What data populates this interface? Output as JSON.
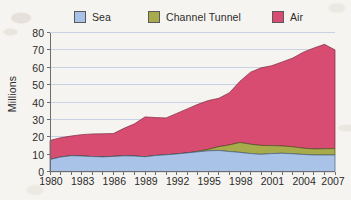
{
  "legend": {
    "items": [
      {
        "label": "Sea",
        "color": "#a9c2e8",
        "x": 74
      },
      {
        "label": "Channel Tunnel",
        "color": "#a7ab4c",
        "x": 148
      },
      {
        "label": "Air",
        "color": "#d94c72",
        "x": 272
      }
    ]
  },
  "axes": {
    "y_title": "Millions",
    "y_ticks": [
      "0",
      "10",
      "20",
      "30",
      "40",
      "50",
      "60",
      "70",
      "80"
    ],
    "x_ticks": [
      "1980",
      "1983",
      "1986",
      "1989",
      "1992",
      "1995",
      "1998",
      "2001",
      "2004",
      "2007"
    ]
  },
  "colors": {
    "sea": "#a9c2e8",
    "channel_tunnel": "#a7ab4c",
    "air": "#d94c72",
    "gridline": "#c9d2e4",
    "axis": "#6d6d6d",
    "text": "#2b2b2b",
    "background": "#f6f4f0"
  },
  "chart_data": {
    "type": "area",
    "stacked": true,
    "title": "",
    "xlabel": "",
    "ylabel": "Millions",
    "ylim": [
      0,
      80
    ],
    "ytick_step": 10,
    "grid": true,
    "legend_position": "top",
    "x": [
      1980,
      1981,
      1982,
      1983,
      1984,
      1985,
      1986,
      1987,
      1988,
      1989,
      1990,
      1991,
      1992,
      1993,
      1994,
      1995,
      1996,
      1997,
      1998,
      1999,
      2000,
      2001,
      2002,
      2003,
      2004,
      2005,
      2006,
      2007
    ],
    "x_tick_labels": [
      "1980",
      "1983",
      "1986",
      "1989",
      "1992",
      "1995",
      "1998",
      "2001",
      "2004",
      "2007"
    ],
    "series": [
      {
        "name": "Sea",
        "color": "#a9c2e8",
        "values": [
          7.0,
          8.4,
          9.2,
          9.0,
          8.7,
          8.5,
          8.8,
          9.1,
          9.0,
          8.6,
          9.3,
          9.7,
          10.2,
          10.8,
          11.4,
          12.0,
          12.2,
          11.6,
          11.1,
          10.4,
          10.0,
          10.4,
          10.6,
          10.3,
          9.9,
          9.6,
          9.6,
          9.6
        ]
      },
      {
        "name": "Channel Tunnel",
        "color": "#a7ab4c",
        "values": [
          0,
          0,
          0,
          0,
          0,
          0,
          0,
          0,
          0,
          0,
          0,
          0,
          0,
          0,
          0.3,
          0.9,
          2.2,
          3.8,
          5.7,
          5.4,
          5.1,
          4.6,
          4.2,
          4.0,
          3.6,
          3.5,
          3.6,
          3.7
        ]
      },
      {
        "name": "Air",
        "color": "#d94c72",
        "values": [
          11.0,
          11.1,
          11.3,
          12.3,
          13.0,
          13.3,
          13.1,
          15.8,
          18.5,
          22.9,
          21.8,
          21.2,
          23.3,
          25.3,
          27.0,
          28.0,
          27.8,
          30.0,
          35.2,
          41.4,
          44.6,
          45.9,
          48.3,
          51.0,
          55.2,
          58.0,
          60.0,
          56.7
        ]
      }
    ],
    "totals": [
      18.0,
      19.5,
      20.5,
      21.3,
      21.7,
      21.8,
      21.9,
      24.9,
      27.5,
      31.5,
      31.1,
      30.9,
      33.5,
      36.1,
      38.7,
      40.9,
      42.2,
      45.4,
      52.0,
      57.2,
      59.7,
      60.9,
      63.1,
      65.3,
      68.7,
      71.1,
      73.2,
      70.0
    ]
  }
}
